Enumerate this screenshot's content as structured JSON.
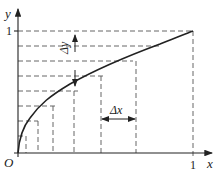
{
  "diagram": {
    "title": "",
    "axes": {
      "x_label": "x",
      "y_label": "y",
      "origin_label": "O",
      "x_tick_label": "1",
      "y_tick_label": "1"
    },
    "annotations": {
      "delta_y": "Δy",
      "delta_x": "Δx"
    },
    "curve": "increasing concave curve from origin to (1,1)",
    "colors": {
      "ink": "#222222",
      "dash": "#555555",
      "background": "#ffffff"
    }
  }
}
